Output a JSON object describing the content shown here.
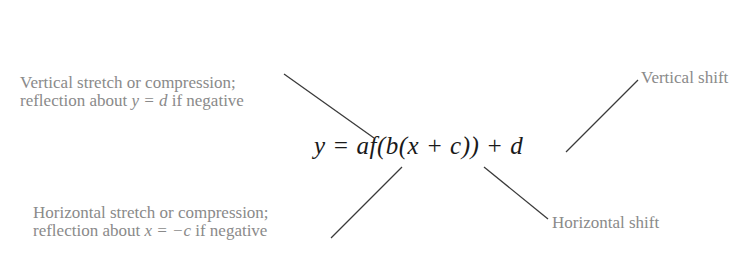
{
  "diagram": {
    "formula": "y = af(b(x + c)) + d",
    "annotations": [
      {
        "id": "a",
        "line1": "Vertical stretch or compression;",
        "line2_prefix": "reflection about ",
        "line2_math": "y = d",
        "line2_suffix": " if negative",
        "points_to": "a"
      },
      {
        "id": "b",
        "line1": "Horizontal stretch or compression;",
        "line2_prefix": "reflection about ",
        "line2_math": "x = −c",
        "line2_suffix": " if negative",
        "points_to": "b"
      },
      {
        "id": "c",
        "text": "Horizontal shift",
        "points_to": "c"
      },
      {
        "id": "d",
        "text": "Vertical shift",
        "points_to": "d"
      }
    ],
    "colors": {
      "label_text": "#8a8a8a",
      "formula_text": "#1a1a1a",
      "leader_line": "#3a3a3a"
    }
  }
}
